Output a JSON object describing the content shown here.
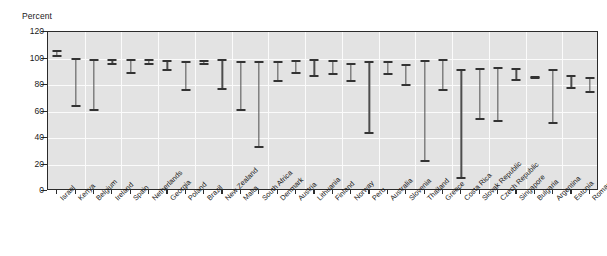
{
  "chart_data": {
    "type": "bar",
    "subtype": "range-floating-bar",
    "title": "",
    "xlabel": "",
    "ylabel": "Percent",
    "ylim": [
      0,
      120
    ],
    "y_ticks": [
      0,
      20,
      40,
      60,
      80,
      100,
      120
    ],
    "y_tick_labels": [
      "0",
      "20",
      "40",
      "60",
      "80",
      "100",
      "120"
    ],
    "grid": true,
    "legend": "none",
    "categories": [
      "Israel",
      "Kenya",
      "Belgium",
      "Ireland",
      "Spain",
      "Netherlands",
      "Georgia",
      "Poland",
      "Brazil",
      "New Zealand",
      "Malta",
      "South Africa",
      "Denmark",
      "Austria",
      "Lithuania",
      "Finland",
      "Norway",
      "Peru",
      "Australia",
      "Slovenia",
      "Thailand",
      "Greece",
      "Costa Rica",
      "Slovak Republic",
      "Czech Republic",
      "Singapore",
      "Bulgaria",
      "Argentina",
      "Estonia",
      "Romania"
    ],
    "series": [
      {
        "name": "Maximum",
        "values": [
          106,
          100,
          99,
          99,
          99,
          99,
          98,
          97,
          98,
          99,
          97,
          97,
          97,
          98,
          99,
          98,
          96,
          97,
          97,
          95,
          98,
          99,
          91,
          92,
          93,
          92,
          86,
          91,
          87,
          85
        ]
      },
      {
        "name": "Minimum",
        "values": [
          102,
          64,
          61,
          96,
          89,
          96,
          91,
          76,
          96,
          77,
          61,
          33,
          83,
          89,
          87,
          88,
          83,
          44,
          88,
          80,
          23,
          76,
          10,
          54,
          53,
          84,
          85,
          51,
          78,
          75
        ]
      }
    ]
  },
  "axis": {
    "y_unit_label": "Percent"
  }
}
